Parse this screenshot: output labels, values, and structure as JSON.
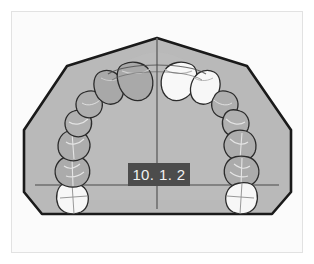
{
  "figure": {
    "label": "10. 1. 2",
    "caption_box_color": "#4c4c4c",
    "caption_text_color": "#f2f2f2",
    "view": "occlusal-view-maxillary-dental-cast",
    "frame_border_color": "#e2e2e2",
    "photo_background_color": "#fbfbfb"
  },
  "cast": {
    "base_name": "trimmed-cast-base",
    "base_fill_color": "#b9b9b9",
    "base_outline_color": "#1a1a1a",
    "palate_fill_color": "#bdbdbd"
  },
  "reference_lines": {
    "midline_name": "midsagittal-reference-line",
    "midline_color": "#6f6f6f",
    "transverse_name": "transverse-reference-line",
    "transverse_color": "#6f6f6f"
  },
  "teeth": {
    "count": 14,
    "outline_color": "#2b2b2b",
    "shaded_fill_color": "#aaaaaa",
    "bright_fill_color": "#f6f6f6",
    "items": [
      {
        "name": "upper-left-second-molar",
        "shade": "bright"
      },
      {
        "name": "upper-left-first-molar",
        "shade": "shaded"
      },
      {
        "name": "upper-left-second-premolar",
        "shade": "shaded"
      },
      {
        "name": "upper-left-first-premolar",
        "shade": "shaded"
      },
      {
        "name": "upper-left-canine",
        "shade": "shaded"
      },
      {
        "name": "upper-left-lateral-incisor",
        "shade": "shaded"
      },
      {
        "name": "upper-left-central-incisor",
        "shade": "shaded"
      },
      {
        "name": "upper-right-central-incisor",
        "shade": "bright"
      },
      {
        "name": "upper-right-lateral-incisor",
        "shade": "bright"
      },
      {
        "name": "upper-right-canine",
        "shade": "shaded"
      },
      {
        "name": "upper-right-first-premolar",
        "shade": "shaded"
      },
      {
        "name": "upper-right-second-premolar",
        "shade": "shaded"
      },
      {
        "name": "upper-right-first-molar",
        "shade": "shaded"
      },
      {
        "name": "upper-right-second-molar",
        "shade": "bright"
      }
    ]
  }
}
